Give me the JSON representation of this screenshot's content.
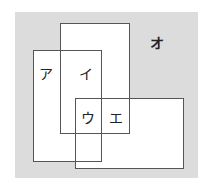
{
  "diagram": {
    "type": "overlapping-rectangles",
    "background_color": "#dcdcdc",
    "regions": [
      {
        "id": "a",
        "label": "ア"
      },
      {
        "id": "i",
        "label": "イ"
      },
      {
        "id": "u",
        "label": "ウ"
      },
      {
        "id": "e",
        "label": "エ"
      },
      {
        "id": "o",
        "label": "オ"
      }
    ],
    "sets": [
      {
        "name": "rect-left",
        "box": [
          33,
          50,
          101,
          161
        ]
      },
      {
        "name": "rect-top",
        "box": [
          60,
          23,
          129,
          133
        ]
      },
      {
        "name": "rect-bottom-right",
        "box": [
          75,
          98,
          183,
          168
        ]
      }
    ]
  }
}
